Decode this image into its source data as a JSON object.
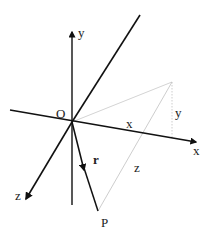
{
  "diagram": {
    "type": "3d-coordinate-axes",
    "colors": {
      "axis": "#111111",
      "construction": "#bbbbbb",
      "background": "#ffffff"
    },
    "labels": {
      "origin": "O",
      "y_axis": "y",
      "x_axis": "x",
      "z_axis": "z",
      "vector": "r",
      "point": "P",
      "x_component": "x",
      "y_component": "y",
      "z_component": "z"
    }
  }
}
